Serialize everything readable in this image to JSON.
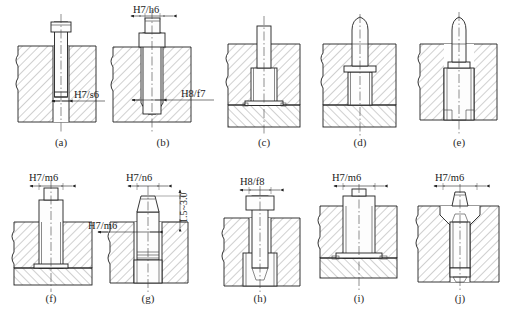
{
  "figure": {
    "line_color": "#1f1f1f",
    "background": "#ffffff",
    "panel_count": 10
  },
  "panels": [
    {
      "id": "a",
      "caption": "(a)",
      "labels": [
        {
          "text": "H7/s6",
          "kind": "leader"
        }
      ]
    },
    {
      "id": "b",
      "caption": "(b)",
      "labels": [
        {
          "text": "H7/h6",
          "kind": "dimension-top"
        },
        {
          "text": "H8/f7",
          "kind": "leader"
        }
      ]
    },
    {
      "id": "c",
      "caption": "(c)",
      "labels": []
    },
    {
      "id": "d",
      "caption": "(d)",
      "labels": []
    },
    {
      "id": "e",
      "caption": "(e)",
      "labels": []
    },
    {
      "id": "f",
      "caption": "(f)",
      "labels": [
        {
          "text": "H7/m6",
          "kind": "dimension-top"
        }
      ]
    },
    {
      "id": "g",
      "caption": "(g)",
      "labels": [
        {
          "text": "H7/n6",
          "kind": "dimension-top"
        },
        {
          "text": "H7/m6",
          "kind": "leader"
        },
        {
          "text": "1.5~3.0",
          "kind": "dimension-vertical"
        }
      ]
    },
    {
      "id": "h",
      "caption": "(h)",
      "labels": [
        {
          "text": "H8/f8",
          "kind": "dimension-top"
        }
      ]
    },
    {
      "id": "i",
      "caption": "(i)",
      "labels": [
        {
          "text": "H7/m6",
          "kind": "dimension-top"
        }
      ]
    },
    {
      "id": "j",
      "caption": "(j)",
      "labels": [
        {
          "text": "H7/m6",
          "kind": "dimension-top"
        }
      ]
    }
  ],
  "captions": {
    "a": "(a)",
    "b": "(b)",
    "c": "(c)",
    "d": "(d)",
    "e": "(e)",
    "f": "(f)",
    "g": "(g)",
    "h": "(h)",
    "i": "(i)",
    "j": "(j)"
  },
  "dimension_labels": {
    "a_fit": "H7/s6",
    "b_fit_top": "H7/h6",
    "b_fit_leader": "H8/f7",
    "f_fit_top": "H7/m6",
    "g_fit_top": "H7/n6",
    "g_fit_leader": "H7/m6",
    "g_height": "1.5~3.0",
    "h_fit_top": "H8/f8",
    "i_fit_top": "H7/m6",
    "j_fit_top": "H7/m6"
  }
}
